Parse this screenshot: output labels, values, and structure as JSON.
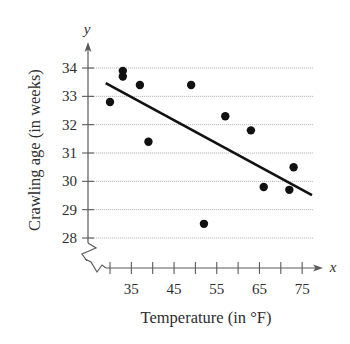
{
  "chart_data": {
    "type": "scatter",
    "title": "",
    "xlabel": "Temperature (in °F)",
    "ylabel": "Crawling age (in weeks)",
    "x_var": "x",
    "y_var": "y",
    "xlim": [
      30,
      77
    ],
    "ylim": [
      28,
      34.8
    ],
    "x_ticks": [
      30,
      35,
      40,
      45,
      50,
      55,
      60,
      65,
      70,
      75
    ],
    "x_tick_labels": [
      "35",
      "45",
      "55",
      "65",
      "75"
    ],
    "x_tick_label_values": [
      35,
      45,
      55,
      65,
      75
    ],
    "y_ticks": [
      28,
      29,
      30,
      31,
      32,
      33,
      34
    ],
    "y_tick_labels": [
      "28",
      "29",
      "30",
      "31",
      "32",
      "33",
      "34"
    ],
    "grid": {
      "horizontal": true,
      "vertical": false
    },
    "axis_break": {
      "x": true,
      "y": true
    },
    "legend": null,
    "series": [
      {
        "name": "observations",
        "points": [
          {
            "x": 30,
            "y": 32.8
          },
          {
            "x": 33,
            "y": 33.9
          },
          {
            "x": 33,
            "y": 33.7
          },
          {
            "x": 37,
            "y": 33.4
          },
          {
            "x": 39,
            "y": 31.4
          },
          {
            "x": 49,
            "y": 33.4
          },
          {
            "x": 52,
            "y": 28.5
          },
          {
            "x": 57,
            "y": 32.3
          },
          {
            "x": 63,
            "y": 31.8
          },
          {
            "x": 66,
            "y": 29.8
          },
          {
            "x": 72,
            "y": 29.7
          },
          {
            "x": 73,
            "y": 30.5
          }
        ]
      }
    ],
    "regression_line": {
      "x_start": 29,
      "y_start": 33.47,
      "x_end": 77.3,
      "y_end": 29.51
    }
  },
  "layout": {
    "x_origin_px": 110,
    "px_per_unit_x": 4.27,
    "y_origin_px": 238,
    "px_per_unit_y": 28.33,
    "y_axis_px": 88,
    "x_axis_py": 268,
    "grid_left_px": 88,
    "grid_right_px": 313,
    "y_axis_top_px": 42,
    "x_axis_right_px": 323
  },
  "colors": {
    "points": "#111111",
    "line": "#111111",
    "grid": "#b8b8b8",
    "axis": "#5a5a5a",
    "text": "#2e2e2e"
  }
}
